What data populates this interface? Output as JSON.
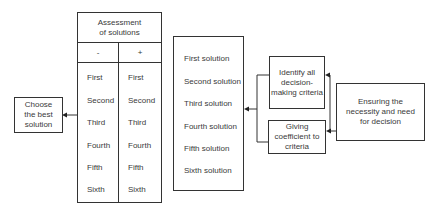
{
  "diagram": {
    "choose_box": {
      "label": "Choose the best solution"
    },
    "assessment": {
      "title": "Assessment of solutions",
      "columns": [
        {
          "sign": "-",
          "items": [
            "First",
            "Second",
            "Third",
            "Fourth",
            "Fifth",
            "Sixth"
          ]
        },
        {
          "sign": "+",
          "items": [
            "First",
            "Second",
            "Third",
            "Fourth",
            "Fifth",
            "Sixth"
          ]
        }
      ]
    },
    "solutions": {
      "items": [
        "First solution",
        "Second solution",
        "Third solution",
        "Fourth solution",
        "Fifth solution",
        "Sixth solution"
      ]
    },
    "identify_box": {
      "label": "Identify all decision-making criteria"
    },
    "giving_box": {
      "label": "Giving coefficient to criteria"
    },
    "ensuring_box": {
      "label": "Ensuring the necessity and need for decision"
    },
    "colors": {
      "stroke": "#333333",
      "text": "#3a3a3a",
      "background": "#ffffff"
    }
  }
}
